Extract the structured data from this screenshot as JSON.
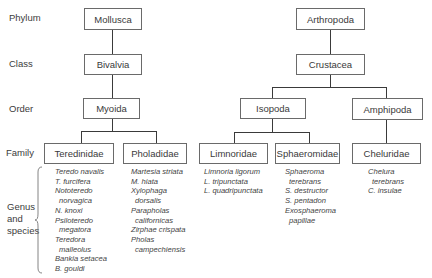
{
  "ranks": {
    "phylum": "Phylum",
    "class": "Class",
    "order": "Order",
    "family": "Family",
    "genus_species": [
      "Genus",
      "and",
      "species"
    ]
  },
  "tree": {
    "mollusca": {
      "phylum": "Mollusca",
      "class": "Bivalvia",
      "order": "Myoida",
      "families": [
        {
          "name": "Teredinidae",
          "species": [
            {
              "text": "Teredo navalis",
              "indent": false
            },
            {
              "text": "T. furcifera",
              "indent": false
            },
            {
              "text": "Nototeredo",
              "indent": false
            },
            {
              "text": "norvagica",
              "indent": true
            },
            {
              "text": "N. knoxi",
              "indent": false
            },
            {
              "text": "Psiloteredo",
              "indent": false
            },
            {
              "text": "megatora",
              "indent": true
            },
            {
              "text": "Teredora",
              "indent": false
            },
            {
              "text": "malleolus",
              "indent": true
            },
            {
              "text": "Bankia setacea",
              "indent": false
            },
            {
              "text": "B. gouldi",
              "indent": false
            }
          ]
        },
        {
          "name": "Pholadidae",
          "species": [
            {
              "text": "Martesia striata",
              "indent": false
            },
            {
              "text": "M. hiata",
              "indent": false
            },
            {
              "text": "Xylophaga",
              "indent": false
            },
            {
              "text": "dorsalis",
              "indent": true
            },
            {
              "text": "Parapholas",
              "indent": false
            },
            {
              "text": "californicas",
              "indent": true
            },
            {
              "text": "Zirphae crispata",
              "indent": false
            },
            {
              "text": "Pholas",
              "indent": false
            },
            {
              "text": "campechiensis",
              "indent": true
            }
          ]
        }
      ]
    },
    "arthropoda": {
      "phylum": "Arthropoda",
      "class": "Crustacea",
      "orders": [
        {
          "name": "Isopoda",
          "families": [
            {
              "name": "Limnoridae",
              "species": [
                {
                  "text": "Limnoria ligorum",
                  "indent": false
                },
                {
                  "text": "L. tripunctata",
                  "indent": false
                },
                {
                  "text": "L. quadripunctata",
                  "indent": false
                }
              ]
            },
            {
              "name": "Sphaeromidae",
              "species": [
                {
                  "text": "Sphaeroma",
                  "indent": false
                },
                {
                  "text": "terebrans",
                  "indent": true
                },
                {
                  "text": "S. destructor",
                  "indent": false
                },
                {
                  "text": "S. pentadon",
                  "indent": false
                },
                {
                  "text": "Exosphaeroma",
                  "indent": false
                },
                {
                  "text": "papillae",
                  "indent": true
                }
              ]
            }
          ]
        },
        {
          "name": "Amphipoda",
          "families": [
            {
              "name": "Cheluridae",
              "species": [
                {
                  "text": "Chelura",
                  "indent": false
                },
                {
                  "text": "terebrans",
                  "indent": true
                },
                {
                  "text": "C. insulae",
                  "indent": false
                }
              ]
            }
          ]
        }
      ]
    }
  },
  "colors": {
    "line": "#3a3a3a",
    "box_border": "#6a6a6a",
    "text": "#3a3a3a"
  }
}
